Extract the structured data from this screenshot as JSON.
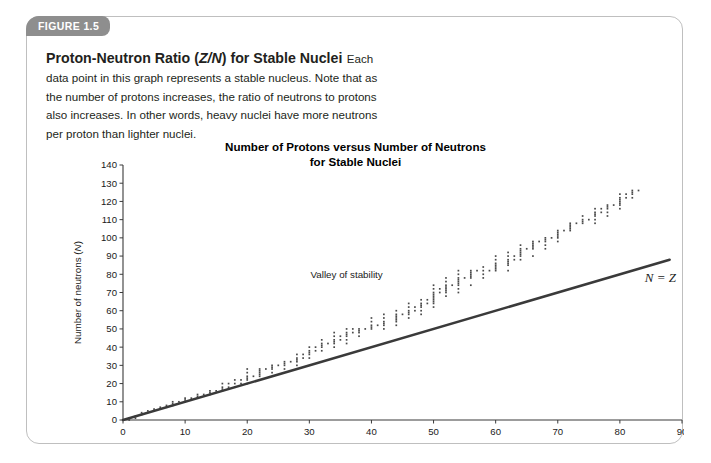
{
  "figure": {
    "badge_label": "FIGURE 1.5",
    "heading_part1": "Proton-Neutron Ratio (",
    "heading_italic": "Z/N",
    "heading_part2": ") for Stable Nuclei",
    "caption": "Each data point in this graph represents a stable nucleus. Note that as the number of protons increases, the ratio of neutrons to protons also increases. In other words, heavy nuclei have more neutrons per proton than lighter nuclei."
  },
  "colors": {
    "badge_background": "#8e8e8e",
    "badge_text": "#ffffff",
    "card_border": "#bfbfbf",
    "axis": "#3b3b3b",
    "line": "#3a3a3a",
    "point": "#4a4a4a",
    "text": "#231f20"
  },
  "chart_data": {
    "type": "scatter",
    "title": "Number of Protons versus Number of Neutrons for Stable Nuclei",
    "title_line1": "Number of Protons versus Number of Neutrons",
    "title_line2": "for Stable Nuclei",
    "xlabel_text": "Number of protons (",
    "xlabel_symbol": "Z",
    "xlabel_close": ")",
    "ylabel_text": "Number of neutrons (",
    "ylabel_symbol": "N",
    "ylabel_close": ")",
    "xlim": [
      0,
      90
    ],
    "ylim": [
      0,
      140
    ],
    "xticks": [
      0,
      10,
      20,
      30,
      40,
      50,
      60,
      70,
      80,
      90
    ],
    "yticks": [
      0,
      10,
      20,
      30,
      40,
      50,
      60,
      70,
      80,
      90,
      100,
      110,
      120,
      130,
      140
    ],
    "grid": false,
    "legend": "none",
    "annotations": [
      {
        "name": "valley-of-stability",
        "text": "Valley of stability",
        "x": 36,
        "y": 78
      },
      {
        "name": "n-equals-z",
        "text": "N = Z",
        "x": 84,
        "y": 76
      }
    ],
    "reference_line": {
      "name": "N = Z",
      "x": [
        0,
        88
      ],
      "y": [
        0,
        88
      ]
    },
    "series": [
      {
        "name": "Stable nuclei",
        "marker": "dot",
        "points": [
          [
            1,
            0
          ],
          [
            1,
            1
          ],
          [
            2,
            1
          ],
          [
            2,
            2
          ],
          [
            3,
            3
          ],
          [
            3,
            4
          ],
          [
            4,
            5
          ],
          [
            5,
            5
          ],
          [
            5,
            6
          ],
          [
            6,
            6
          ],
          [
            6,
            7
          ],
          [
            7,
            7
          ],
          [
            7,
            8
          ],
          [
            8,
            8
          ],
          [
            8,
            9
          ],
          [
            8,
            10
          ],
          [
            9,
            10
          ],
          [
            10,
            10
          ],
          [
            10,
            11
          ],
          [
            10,
            12
          ],
          [
            11,
            12
          ],
          [
            12,
            12
          ],
          [
            12,
            13
          ],
          [
            12,
            14
          ],
          [
            13,
            14
          ],
          [
            14,
            14
          ],
          [
            14,
            15
          ],
          [
            14,
            16
          ],
          [
            15,
            16
          ],
          [
            16,
            16
          ],
          [
            16,
            17
          ],
          [
            16,
            18
          ],
          [
            16,
            20
          ],
          [
            17,
            18
          ],
          [
            17,
            20
          ],
          [
            18,
            18
          ],
          [
            18,
            20
          ],
          [
            18,
            22
          ],
          [
            19,
            20
          ],
          [
            19,
            22
          ],
          [
            20,
            20
          ],
          [
            20,
            22
          ],
          [
            20,
            23
          ],
          [
            20,
            24
          ],
          [
            20,
            26
          ],
          [
            20,
            28
          ],
          [
            21,
            24
          ],
          [
            22,
            24
          ],
          [
            22,
            25
          ],
          [
            22,
            26
          ],
          [
            22,
            27
          ],
          [
            22,
            28
          ],
          [
            23,
            28
          ],
          [
            24,
            26
          ],
          [
            24,
            28
          ],
          [
            24,
            29
          ],
          [
            24,
            30
          ],
          [
            25,
            30
          ],
          [
            26,
            28
          ],
          [
            26,
            30
          ],
          [
            26,
            31
          ],
          [
            26,
            32
          ],
          [
            27,
            32
          ],
          [
            28,
            30
          ],
          [
            28,
            32
          ],
          [
            28,
            33
          ],
          [
            28,
            34
          ],
          [
            28,
            36
          ],
          [
            29,
            34
          ],
          [
            29,
            36
          ],
          [
            30,
            34
          ],
          [
            30,
            36
          ],
          [
            30,
            37
          ],
          [
            30,
            38
          ],
          [
            30,
            40
          ],
          [
            31,
            38
          ],
          [
            31,
            40
          ],
          [
            32,
            38
          ],
          [
            32,
            40
          ],
          [
            32,
            41
          ],
          [
            32,
            42
          ],
          [
            32,
            44
          ],
          [
            33,
            42
          ],
          [
            34,
            40
          ],
          [
            34,
            42
          ],
          [
            34,
            43
          ],
          [
            34,
            44
          ],
          [
            34,
            46
          ],
          [
            34,
            48
          ],
          [
            35,
            44
          ],
          [
            35,
            46
          ],
          [
            36,
            42
          ],
          [
            36,
            44
          ],
          [
            36,
            46
          ],
          [
            36,
            47
          ],
          [
            36,
            48
          ],
          [
            36,
            50
          ],
          [
            37,
            48
          ],
          [
            37,
            50
          ],
          [
            38,
            46
          ],
          [
            38,
            48
          ],
          [
            38,
            49
          ],
          [
            38,
            50
          ],
          [
            39,
            50
          ],
          [
            40,
            50
          ],
          [
            40,
            51
          ],
          [
            40,
            52
          ],
          [
            40,
            54
          ],
          [
            40,
            56
          ],
          [
            41,
            52
          ],
          [
            42,
            50
          ],
          [
            42,
            52
          ],
          [
            42,
            53
          ],
          [
            42,
            54
          ],
          [
            42,
            56
          ],
          [
            42,
            58
          ],
          [
            44,
            52
          ],
          [
            44,
            54
          ],
          [
            44,
            55
          ],
          [
            44,
            56
          ],
          [
            44,
            57
          ],
          [
            44,
            58
          ],
          [
            44,
            60
          ],
          [
            45,
            58
          ],
          [
            46,
            56
          ],
          [
            46,
            58
          ],
          [
            46,
            59
          ],
          [
            46,
            60
          ],
          [
            46,
            62
          ],
          [
            46,
            64
          ],
          [
            47,
            60
          ],
          [
            47,
            62
          ],
          [
            48,
            58
          ],
          [
            48,
            60
          ],
          [
            48,
            62
          ],
          [
            48,
            63
          ],
          [
            48,
            64
          ],
          [
            48,
            66
          ],
          [
            49,
            64
          ],
          [
            49,
            66
          ],
          [
            50,
            62
          ],
          [
            50,
            64
          ],
          [
            50,
            65
          ],
          [
            50,
            66
          ],
          [
            50,
            67
          ],
          [
            50,
            68
          ],
          [
            50,
            69
          ],
          [
            50,
            70
          ],
          [
            50,
            72
          ],
          [
            50,
            74
          ],
          [
            51,
            70
          ],
          [
            51,
            72
          ],
          [
            52,
            68
          ],
          [
            52,
            70
          ],
          [
            52,
            71
          ],
          [
            52,
            72
          ],
          [
            52,
            73
          ],
          [
            52,
            74
          ],
          [
            52,
            76
          ],
          [
            52,
            78
          ],
          [
            53,
            74
          ],
          [
            54,
            70
          ],
          [
            54,
            72
          ],
          [
            54,
            74
          ],
          [
            54,
            75
          ],
          [
            54,
            76
          ],
          [
            54,
            77
          ],
          [
            54,
            78
          ],
          [
            54,
            80
          ],
          [
            54,
            82
          ],
          [
            55,
            78
          ],
          [
            56,
            74
          ],
          [
            56,
            78
          ],
          [
            56,
            79
          ],
          [
            56,
            80
          ],
          [
            56,
            81
          ],
          [
            56,
            82
          ],
          [
            57,
            82
          ],
          [
            58,
            78
          ],
          [
            58,
            80
          ],
          [
            58,
            82
          ],
          [
            58,
            84
          ],
          [
            59,
            82
          ],
          [
            60,
            82
          ],
          [
            60,
            83
          ],
          [
            60,
            84
          ],
          [
            60,
            85
          ],
          [
            60,
            86
          ],
          [
            60,
            88
          ],
          [
            60,
            90
          ],
          [
            62,
            82
          ],
          [
            62,
            85
          ],
          [
            62,
            86
          ],
          [
            62,
            87
          ],
          [
            62,
            88
          ],
          [
            62,
            90
          ],
          [
            62,
            92
          ],
          [
            63,
            88
          ],
          [
            63,
            90
          ],
          [
            64,
            88
          ],
          [
            64,
            90
          ],
          [
            64,
            91
          ],
          [
            64,
            92
          ],
          [
            64,
            93
          ],
          [
            64,
            94
          ],
          [
            64,
            96
          ],
          [
            65,
            94
          ],
          [
            66,
            90
          ],
          [
            66,
            94
          ],
          [
            66,
            95
          ],
          [
            66,
            96
          ],
          [
            66,
            97
          ],
          [
            66,
            98
          ],
          [
            67,
            98
          ],
          [
            68,
            94
          ],
          [
            68,
            96
          ],
          [
            68,
            98
          ],
          [
            68,
            99
          ],
          [
            68,
            100
          ],
          [
            69,
            100
          ],
          [
            70,
            98
          ],
          [
            70,
            100
          ],
          [
            70,
            101
          ],
          [
            70,
            102
          ],
          [
            70,
            103
          ],
          [
            70,
            104
          ],
          [
            71,
            104
          ],
          [
            72,
            104
          ],
          [
            72,
            105
          ],
          [
            72,
            106
          ],
          [
            72,
            107
          ],
          [
            72,
            108
          ],
          [
            73,
            108
          ],
          [
            74,
            108
          ],
          [
            74,
            109
          ],
          [
            74,
            110
          ],
          [
            74,
            112
          ],
          [
            75,
            110
          ],
          [
            76,
            108
          ],
          [
            76,
            110
          ],
          [
            76,
            112
          ],
          [
            76,
            113
          ],
          [
            76,
            114
          ],
          [
            76,
            116
          ],
          [
            77,
            114
          ],
          [
            77,
            116
          ],
          [
            78,
            112
          ],
          [
            78,
            114
          ],
          [
            78,
            116
          ],
          [
            78,
            117
          ],
          [
            78,
            118
          ],
          [
            79,
            118
          ],
          [
            80,
            116
          ],
          [
            80,
            118
          ],
          [
            80,
            119
          ],
          [
            80,
            120
          ],
          [
            80,
            121
          ],
          [
            80,
            122
          ],
          [
            80,
            124
          ],
          [
            81,
            122
          ],
          [
            81,
            124
          ],
          [
            82,
            122
          ],
          [
            82,
            124
          ],
          [
            82,
            125
          ],
          [
            82,
            126
          ],
          [
            83,
            126
          ]
        ]
      }
    ]
  }
}
